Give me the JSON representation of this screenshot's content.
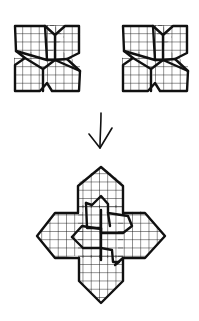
{
  "diagram": {
    "colors": {
      "stroke": "#111111",
      "background": "#ffffff"
    },
    "tiles": [
      {
        "name": "tile-left",
        "x": 14,
        "y": 25,
        "size": 66
      },
      {
        "name": "tile-right",
        "x": 122,
        "y": 25,
        "size": 66
      }
    ],
    "arrow": {
      "direction": "down",
      "x": 100,
      "y1": 113,
      "y2": 148
    },
    "result": {
      "name": "combined-figure",
      "cx": 100,
      "cy": 230
    }
  }
}
